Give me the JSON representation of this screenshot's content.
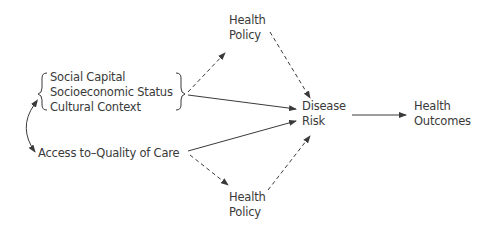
{
  "diagram": {
    "type": "causal-pathway",
    "nodes": {
      "social_group": {
        "items": [
          "Social Capital",
          "Socioeconomic Status",
          "Cultural Context"
        ]
      },
      "access": {
        "label": "Access to–Quality of Care"
      },
      "health_policy_top": {
        "lines": [
          "Health",
          "Policy"
        ]
      },
      "health_policy_bottom": {
        "lines": [
          "Health",
          "Policy"
        ]
      },
      "disease_risk": {
        "lines": [
          "Disease",
          "Risk"
        ]
      },
      "health_outcomes": {
        "lines": [
          "Health",
          "Outcomes"
        ]
      }
    },
    "edges": [
      {
        "from": "social_group",
        "to": "health_policy_top",
        "style": "dashed"
      },
      {
        "from": "social_group",
        "to": "disease_risk",
        "style": "solid"
      },
      {
        "from": "access",
        "to": "disease_risk",
        "style": "solid"
      },
      {
        "from": "access",
        "to": "health_policy_bottom",
        "style": "dashed"
      },
      {
        "from": "health_policy_top",
        "to": "disease_risk",
        "style": "dashed"
      },
      {
        "from": "health_policy_bottom",
        "to": "disease_risk",
        "style": "dashed"
      },
      {
        "from": "disease_risk",
        "to": "health_outcomes",
        "style": "solid"
      },
      {
        "from": "social_group",
        "to": "access",
        "style": "solid-curved-bidirectional"
      }
    ],
    "colors": {
      "ink": "#3a3a3a",
      "background": "#ffffff"
    }
  }
}
